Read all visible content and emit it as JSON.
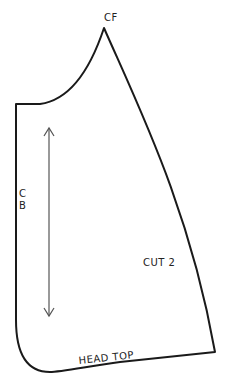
{
  "pattern": {
    "labels": {
      "cf": "CF",
      "cb_c": "C",
      "cb_b": "B",
      "cut": "CUT 2",
      "head_top": "HEAD TOP"
    },
    "colors": {
      "outline": "#1a1a1a",
      "grainline": "#555555"
    }
  }
}
